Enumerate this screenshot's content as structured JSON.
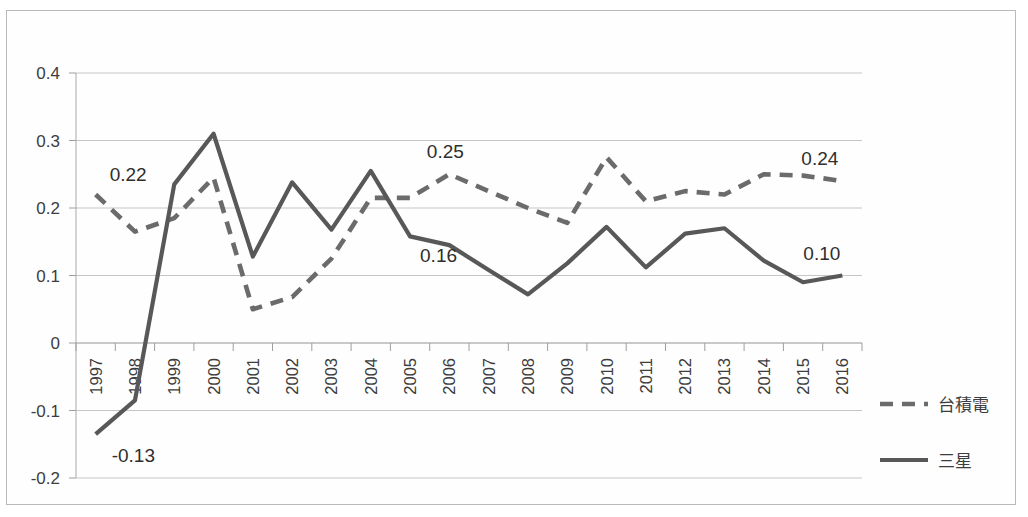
{
  "chart_data": {
    "type": "line",
    "title": "",
    "xlabel": "",
    "ylabel": "",
    "grid": true,
    "legend_position": "right",
    "ylim": [
      -0.2,
      0.4
    ],
    "ytick_labels": [
      "0.4",
      "0.3",
      "0.2",
      "0.1",
      "0",
      "-0.1",
      "-0.2"
    ],
    "ytick_values": [
      0.4,
      0.3,
      0.2,
      0.1,
      0,
      -0.1,
      -0.2
    ],
    "categories": [
      "1997",
      "1998",
      "1999",
      "2000",
      "2001",
      "2002",
      "2003",
      "2004",
      "2005",
      "2006",
      "2007",
      "2008",
      "2009",
      "2010",
      "2011",
      "2012",
      "2013",
      "2014",
      "2015",
      "2016"
    ],
    "series": [
      {
        "name": "台積電",
        "style": "dashed",
        "color": "#6b6b6b",
        "values": [
          0.22,
          0.165,
          0.185,
          0.245,
          0.05,
          0.068,
          0.125,
          0.215,
          0.215,
          0.25,
          0.225,
          0.2,
          0.178,
          0.275,
          0.21,
          0.225,
          0.22,
          0.25,
          0.248,
          0.24
        ]
      },
      {
        "name": "三星",
        "style": "solid",
        "color": "#585858",
        "values": [
          -0.135,
          -0.085,
          0.235,
          0.31,
          0.128,
          0.238,
          0.168,
          0.255,
          0.158,
          0.145,
          0.108,
          0.072,
          0.118,
          0.172,
          0.112,
          0.162,
          0.17,
          0.122,
          0.09,
          0.1
        ]
      }
    ],
    "annotations": [
      {
        "text": "0.22",
        "series": "台積電",
        "category": "1997",
        "value": 0.22
      },
      {
        "text": "-0.13",
        "series": "三星",
        "category": "1997",
        "value": -0.135
      },
      {
        "text": "0.16",
        "series": "三星",
        "category": "2005",
        "value": 0.158
      },
      {
        "text": "0.25",
        "series": "台積電",
        "category": "2006",
        "value": 0.25
      },
      {
        "text": "0.24",
        "series": "台積電",
        "category": "2016",
        "value": 0.24
      },
      {
        "text": "0.10",
        "series": "三星",
        "category": "2016",
        "value": 0.1
      }
    ]
  },
  "legend": {
    "items": [
      {
        "label": "台積電",
        "style": "dashed"
      },
      {
        "label": "三星",
        "style": "solid"
      }
    ]
  }
}
